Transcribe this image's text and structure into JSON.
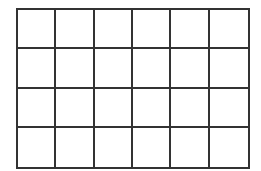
{
  "grid": {
    "rows": 4,
    "columns": 6,
    "line_color": "#333333",
    "background": "#ffffff"
  }
}
